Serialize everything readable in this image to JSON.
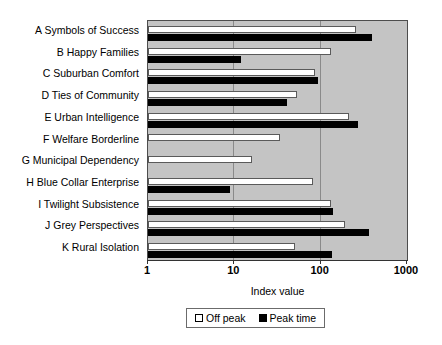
{
  "chart_data": {
    "type": "bar",
    "orientation": "horizontal",
    "title": "",
    "xlabel": "Index value",
    "ylabel": "",
    "xscale": "log",
    "xlim": [
      1,
      1000
    ],
    "xticks": [
      1,
      10,
      100,
      1000
    ],
    "xtick_labels": [
      "1",
      "10",
      "100",
      "1000"
    ],
    "grid": true,
    "grid_axis": "x",
    "legend_position": "bottom-center",
    "categories": [
      "A Symbols of Success",
      "B Happy Families",
      "C Suburban Comfort",
      "D Ties of Community",
      "E Urban Intelligence",
      "F Welfare Borderline",
      "G Municipal Dependency",
      "H Blue Collar Enterprise",
      "I Twilight Subsistence",
      "J Grey Perspectives",
      "K Rural Isolation"
    ],
    "series": [
      {
        "name": "Off peak",
        "color": "#ffffff",
        "values": [
          260,
          130,
          85,
          53,
          215,
          34,
          16,
          82,
          130,
          190,
          50
        ]
      },
      {
        "name": "Peak time",
        "color": "#000000",
        "values": [
          390,
          12,
          92,
          41,
          270,
          null,
          null,
          9,
          140,
          360,
          135
        ]
      }
    ]
  },
  "legend": {
    "items": [
      {
        "label": "Off peak",
        "swatch": "off-peak-swatch"
      },
      {
        "label": "Peak time",
        "swatch": "peak-time-swatch"
      }
    ]
  },
  "axis": {
    "x_title": "Index value"
  },
  "colors": {
    "plot_background": "#c4c4c4",
    "gridline": "#8a8a8a",
    "plot_border": "#4d4d4d",
    "off_peak": "#ffffff",
    "peak_time": "#000000"
  }
}
